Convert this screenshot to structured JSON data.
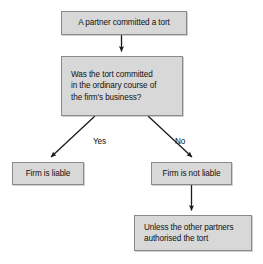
{
  "diagram": {
    "colors": {
      "node_fill": "#d8d8d8",
      "node_border": "#8a8a8a",
      "text": "#111111",
      "connector": "#1a1a1a",
      "background": "#ffffff"
    },
    "nodes": [
      {
        "id": "tort-committed",
        "name": "node-partner-committed-tort",
        "text": "A partner committed a tort",
        "align": "center",
        "x": 61,
        "y": 11,
        "w": 126,
        "h": 24
      },
      {
        "id": "ordinary-course-question",
        "name": "node-ordinary-course-question",
        "text": "Was the tort committed\nin the ordinary course of\nthe firm's business?",
        "align": "left",
        "x": 61,
        "y": 56,
        "w": 122,
        "h": 60
      },
      {
        "id": "firm-liable",
        "name": "node-firm-is-liable",
        "text": "Firm is liable",
        "align": "center",
        "x": 12,
        "y": 162,
        "w": 72,
        "h": 23
      },
      {
        "id": "firm-not-liable",
        "name": "node-firm-is-not-liable",
        "text": "Firm is not liable",
        "align": "center",
        "x": 151,
        "y": 162,
        "w": 81,
        "h": 23
      },
      {
        "id": "unless-authorised",
        "name": "node-unless-other-partners-authorised",
        "text": "Unless the other partners\nauthorised the tort",
        "align": "left",
        "x": 134,
        "y": 215,
        "w": 118,
        "h": 36
      }
    ],
    "edges": [
      {
        "id": "edge-tort-to-question",
        "name": "connector-tort-to-question",
        "from": "tort-committed",
        "to": "ordinary-course-question",
        "label": ""
      },
      {
        "id": "edge-question-to-liable",
        "name": "connector-question-yes-to-firm-liable",
        "from": "ordinary-course-question",
        "to": "firm-liable",
        "label": "Yes",
        "label_x": 93,
        "label_y": 137
      },
      {
        "id": "edge-question-to-not-liable",
        "name": "connector-question-no-to-firm-not-liable",
        "from": "ordinary-course-question",
        "to": "firm-not-liable",
        "label": "No",
        "label_x": 175,
        "label_y": 137
      },
      {
        "id": "edge-not-liable-to-unless",
        "name": "connector-not-liable-to-unless",
        "from": "firm-not-liable",
        "to": "unless-authorised",
        "label": ""
      }
    ]
  }
}
